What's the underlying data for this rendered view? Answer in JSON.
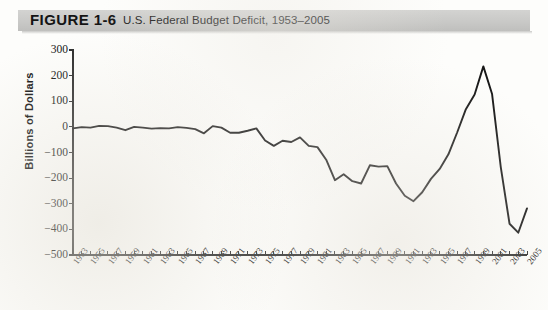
{
  "figure": {
    "label": "FIGURE 1-6",
    "title": "U.S. Federal Budget Deficit, 1953–2005"
  },
  "colors": {
    "banner": "#c9c9c7",
    "line": "#171717",
    "axis": "#2b2b2b",
    "page": "#fdfdfb"
  },
  "chart_data": {
    "type": "line",
    "title": "U.S. Federal Budget Deficit, 1953–2005",
    "xlabel": "",
    "ylabel": "Billions of Dollars",
    "ylim": [
      -500,
      300
    ],
    "yticks": [
      300,
      200,
      100,
      0,
      -100,
      -200,
      -300,
      -400,
      -500
    ],
    "ytick_labels": [
      "300",
      "200",
      "100",
      "0",
      "−100",
      "−200",
      "−300",
      "−400",
      "−500"
    ],
    "xlim": [
      1953,
      2005
    ],
    "xtick_labels": [
      "1953",
      "1955",
      "1957",
      "1959",
      "1961",
      "1963",
      "1965",
      "1967",
      "1969",
      "1971",
      "1973",
      "1975",
      "1977",
      "1979",
      "1981",
      "1983",
      "1985",
      "1987",
      "1989",
      "1991",
      "1993",
      "1995",
      "1997",
      "1999",
      "2001",
      "2003",
      "2005"
    ],
    "xtick_step_years": 2,
    "minor_tick_step_years": 1,
    "grid": false,
    "legend": null,
    "series": [
      {
        "name": "Federal budget surplus/deficit",
        "x": [
          1953,
          1954,
          1955,
          1956,
          1957,
          1958,
          1959,
          1960,
          1961,
          1962,
          1963,
          1964,
          1965,
          1966,
          1967,
          1968,
          1969,
          1970,
          1971,
          1972,
          1973,
          1974,
          1975,
          1976,
          1977,
          1978,
          1979,
          1980,
          1981,
          1982,
          1983,
          1984,
          1985,
          1986,
          1987,
          1988,
          1989,
          1990,
          1991,
          1992,
          1993,
          1994,
          1995,
          1996,
          1997,
          1998,
          1999,
          2000,
          2001,
          2002,
          2003,
          2004,
          2005
        ],
        "values": [
          -6,
          -1,
          -3,
          4,
          3,
          -3,
          -13,
          0,
          -3,
          -7,
          -5,
          -6,
          -1,
          -4,
          -9,
          -25,
          3,
          -3,
          -23,
          -23,
          -15,
          -6,
          -53,
          -74,
          -54,
          -59,
          -41,
          -74,
          -79,
          -128,
          -208,
          -185,
          -212,
          -221,
          -150,
          -155,
          -153,
          -221,
          -269,
          -290,
          -255,
          -203,
          -164,
          -107,
          -22,
          69,
          126,
          236,
          128,
          -158,
          -378,
          -413,
          -318
        ]
      }
    ]
  }
}
